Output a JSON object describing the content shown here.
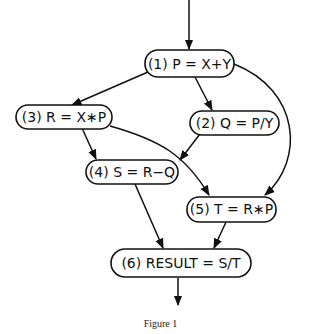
{
  "diagram": {
    "type": "dataflow-graph",
    "nodes": [
      {
        "id": "n1",
        "label": "(1) P = X+Y"
      },
      {
        "id": "n2",
        "label": "(2) Q = P/Y"
      },
      {
        "id": "n3",
        "label": "(3) R = X∗P"
      },
      {
        "id": "n4",
        "label": "(4) S = R−Q"
      },
      {
        "id": "n5",
        "label": "(5) T = R∗P"
      },
      {
        "id": "n6",
        "label": "(6) RESULT = S/T"
      }
    ],
    "edges": [
      {
        "from": "input",
        "to": "n1"
      },
      {
        "from": "n1",
        "to": "n3"
      },
      {
        "from": "n1",
        "to": "n2"
      },
      {
        "from": "n1",
        "to": "n5"
      },
      {
        "from": "n3",
        "to": "n4"
      },
      {
        "from": "n3",
        "to": "n5"
      },
      {
        "from": "n2",
        "to": "n4"
      },
      {
        "from": "n4",
        "to": "n6"
      },
      {
        "from": "n5",
        "to": "n6"
      },
      {
        "from": "n6",
        "to": "output"
      }
    ]
  },
  "caption": "Figure 1"
}
